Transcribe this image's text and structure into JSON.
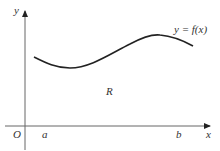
{
  "diagram": {
    "axes": {
      "x_label": "x",
      "y_label": "y",
      "origin_label": "O"
    },
    "curve_label": "y = f(x)",
    "region_label": "R",
    "bounds": {
      "a_label": "a",
      "b_label": "b"
    },
    "colors": {
      "axis": "#555555",
      "curve": "#222222",
      "text": "#333333"
    }
  }
}
